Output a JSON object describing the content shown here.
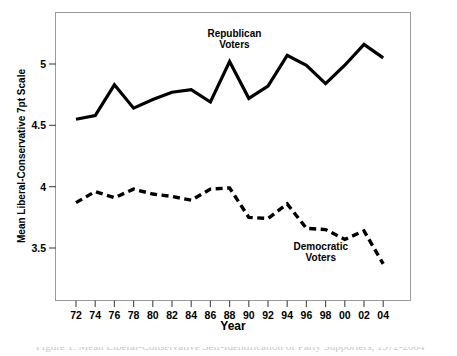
{
  "chart_data": {
    "type": "line",
    "title": "",
    "xlabel": "Year",
    "ylabel": "Mean Liberal-Conservative 7pt Scale",
    "x": [
      72,
      74,
      76,
      78,
      80,
      82,
      84,
      86,
      88,
      90,
      92,
      94,
      96,
      98,
      "00",
      "02",
      "04"
    ],
    "xticklabels": [
      "72",
      "74",
      "76",
      "78",
      "80",
      "82",
      "84",
      "86",
      "88",
      "90",
      "92",
      "94",
      "96",
      "98",
      "00",
      "02",
      "04"
    ],
    "yticklabels": [
      "3.5",
      "4",
      "4.5",
      "5"
    ],
    "yticks": [
      3.5,
      4,
      4.5,
      5
    ],
    "ylim": [
      3.25,
      5.28
    ],
    "xlim": [
      71.2,
      4.8
    ],
    "grid": false,
    "legend_position": "inline-annotations",
    "series": [
      {
        "name": "Republican Voters",
        "style": "solid",
        "color": "#000000",
        "values": [
          4.55,
          4.58,
          4.83,
          4.64,
          4.71,
          4.77,
          4.79,
          4.69,
          5.02,
          4.72,
          4.82,
          5.07,
          4.99,
          4.84,
          4.99,
          5.16,
          5.05
        ]
      },
      {
        "name": "Democratic Voters",
        "style": "dashed",
        "color": "#000000",
        "values": [
          3.87,
          3.96,
          3.91,
          3.98,
          3.94,
          3.92,
          3.89,
          3.98,
          3.99,
          3.75,
          3.74,
          3.86,
          3.66,
          3.65,
          3.57,
          3.64,
          3.37
        ]
      }
    ],
    "annotations": [
      {
        "text_line1": "Republican",
        "text_line2": "Voters",
        "x": 88.5,
        "y": 5.22
      },
      {
        "text_line1": "Democratic",
        "text_line2": "Voters",
        "x": 97.5,
        "y": 3.48
      }
    ]
  },
  "caption": {
    "text": "Figure 1. Mean Liberal-Conservative Self-Identification of Party Supporters, 1972-2004"
  }
}
